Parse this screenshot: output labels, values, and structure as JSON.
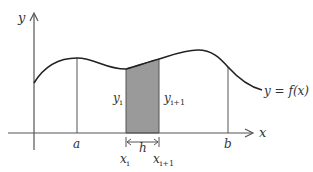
{
  "diagram": {
    "labels": {
      "y_axis": "y",
      "x_axis": "x",
      "a": "a",
      "b": "b",
      "h": "h",
      "curve": "y = f(x)",
      "x_i_base": "x",
      "x_i_sub": "i",
      "x_i1_base": "x",
      "x_i1_sub": "i+1",
      "y_i_base": "y",
      "y_i_sub": "i",
      "y_i1_base": "y",
      "y_i1_sub": "i+1"
    },
    "colors": {
      "line": "#222222",
      "axis": "#555555",
      "shade": "#9a9a9a",
      "background": "#ffffff"
    }
  }
}
